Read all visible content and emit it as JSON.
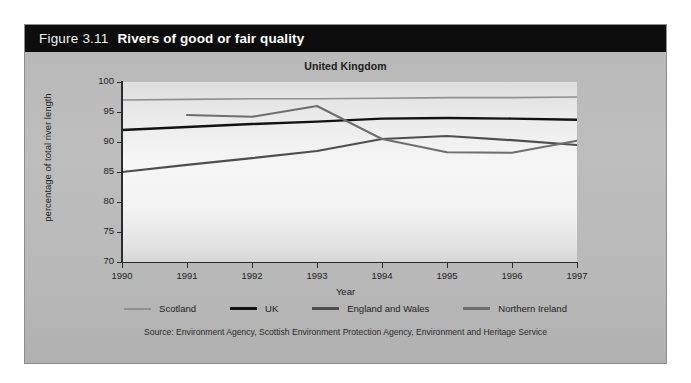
{
  "figure": {
    "number": "Figure 3.11",
    "title": "Rivers of good or fair quality"
  },
  "source": "Source: Environment Agency, Scottish Environment Protection Agency, Environment and Heritage Service",
  "colors": {
    "header_bar": "#0d0d0d",
    "panel": "#b9b9b9",
    "plot_bg": "#f4f4f4",
    "axis": "#2b2b2b",
    "scotland": "#8f8f8f",
    "uk": "#121212",
    "england_and_wales": "#4e4e4e",
    "northern_ireland": "#6e6e6e"
  },
  "chart_data": {
    "type": "line",
    "title": "Rivers of good or fair quality",
    "subtitle": "United Kingdom",
    "xlabel": "Year",
    "ylabel": "percentage of total river length",
    "categories": [
      1990,
      1991,
      1992,
      1993,
      1994,
      1995,
      1996,
      1997
    ],
    "xtick_labels": [
      "1990",
      "1991",
      "1992",
      "1993",
      "1994",
      "1995",
      "1996",
      "1997"
    ],
    "ytick_labels": [
      "70",
      "75",
      "80",
      "85",
      "90",
      "95",
      "100"
    ],
    "yticks": [
      70,
      75,
      80,
      85,
      90,
      95,
      100
    ],
    "ylim": [
      70,
      100
    ],
    "xlim": [
      1990,
      1997
    ],
    "grid": false,
    "legend_position": "below-axes",
    "series": [
      {
        "name": "Scotland",
        "color": "#8f8f8f",
        "values": [
          97.0,
          97.1,
          97.2,
          97.2,
          97.3,
          97.4,
          97.4,
          97.5
        ]
      },
      {
        "name": "UK",
        "color": "#121212",
        "values": [
          92.0,
          92.5,
          93.0,
          93.4,
          93.9,
          94.0,
          93.9,
          93.7
        ]
      },
      {
        "name": "England and Wales",
        "color": "#4e4e4e",
        "values": [
          85.0,
          86.2,
          87.3,
          88.5,
          90.5,
          91.0,
          90.3,
          89.5
        ]
      },
      {
        "name": "Northern Ireland",
        "color": "#6e6e6e",
        "values": [
          null,
          94.5,
          94.2,
          96.0,
          90.5,
          88.3,
          88.2,
          90.2
        ]
      }
    ]
  }
}
